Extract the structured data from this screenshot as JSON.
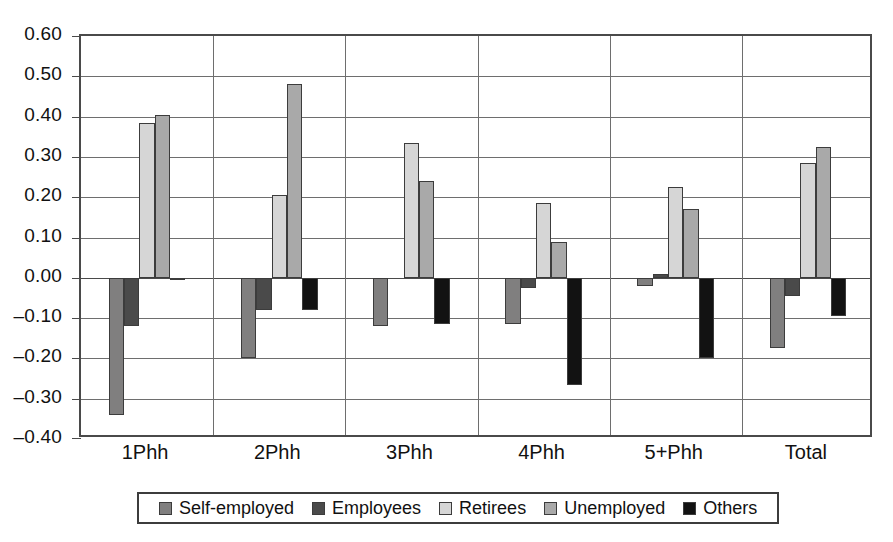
{
  "chart_data": {
    "type": "bar",
    "title": "",
    "subtitle": "",
    "xlabel": "",
    "ylabel": "",
    "grid": true,
    "legend_position": "bottom",
    "orientation": "vertical",
    "categories": [
      "1Phh",
      "2Phh",
      "3Phh",
      "4Phh",
      "5+Phh",
      "Total"
    ],
    "ylim": [
      -0.4,
      0.6
    ],
    "yticks": [
      0.6,
      0.5,
      0.4,
      0.3,
      0.2,
      0.1,
      0.0,
      -0.1,
      -0.2,
      -0.3,
      -0.4
    ],
    "ytick_labels": [
      "0.60",
      "0.50",
      "0.40",
      "0.30",
      "0.20",
      "0.10",
      "0.00",
      "–0.10",
      "–0.20",
      "–0.30",
      "–0.40"
    ],
    "series": [
      {
        "name": "Self-employed",
        "color": "#807f7f",
        "values": [
          -0.34,
          -0.2,
          -0.12,
          -0.115,
          -0.02,
          -0.175
        ]
      },
      {
        "name": "Employees",
        "color": "#4a4a4a",
        "values": [
          -0.12,
          -0.08,
          0.0,
          -0.025,
          0.01,
          -0.045
        ]
      },
      {
        "name": "Retirees",
        "color": "#d6d6d6",
        "values": [
          0.385,
          0.205,
          0.335,
          0.185,
          0.225,
          0.285
        ]
      },
      {
        "name": "Unemployed",
        "color": "#a9a9a9",
        "values": [
          0.405,
          0.48,
          0.24,
          0.09,
          0.17,
          0.325
        ]
      },
      {
        "name": "Others",
        "color": "#121212",
        "values": [
          -0.005,
          -0.08,
          -0.115,
          -0.265,
          -0.2,
          -0.095
        ]
      }
    ]
  }
}
